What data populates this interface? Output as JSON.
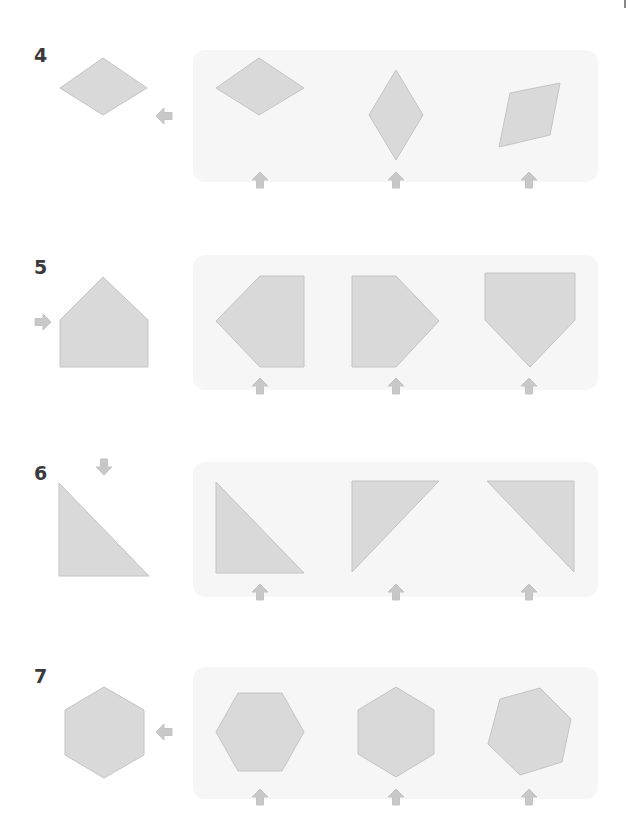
{
  "worksheet": {
    "colors": {
      "shape_fill": "#d9d9d9",
      "shape_stroke": "#c4c4c4",
      "arrow": "#c8c8c8",
      "panel": "#f6f6f6",
      "number": "#3a3a3a"
    },
    "problems": [
      {
        "number": "4",
        "reference_shape": "rhombus-wide",
        "direction_arrow": "left",
        "options": [
          "rhombus-wide",
          "rhombus-tall",
          "rhombus-tilted"
        ]
      },
      {
        "number": "5",
        "reference_shape": "pentagon-house",
        "direction_arrow": "right",
        "options": [
          "pentagon-point-left",
          "pentagon-point-right",
          "pentagon-point-down"
        ]
      },
      {
        "number": "6",
        "reference_shape": "right-triangle",
        "direction_arrow": "down",
        "options": [
          "right-triangle-bottom-left",
          "right-triangle-top-left",
          "right-triangle-top-right"
        ]
      },
      {
        "number": "7",
        "reference_shape": "hexagon-pointy-top",
        "direction_arrow": "left",
        "options": [
          "hexagon-flat-top",
          "hexagon-pointy-top",
          "hexagon-rotated"
        ]
      }
    ]
  }
}
